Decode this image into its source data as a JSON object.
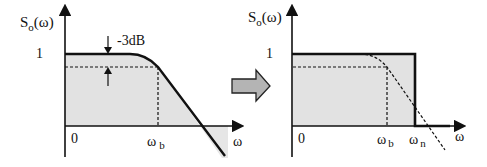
{
  "diagram": {
    "left_plot": {
      "y_axis_label": "S",
      "y_axis_label_sub": "o",
      "y_axis_label_arg": "(ω)",
      "y_tick_one": "1",
      "attenuation_label": "-3dB",
      "origin_label": "0",
      "x_tick_b": "ω",
      "x_tick_b_sub": "b",
      "x_axis_label": "ω"
    },
    "right_plot": {
      "y_axis_label": "S",
      "y_axis_label_sub": "o",
      "y_axis_label_arg": "(ω)",
      "y_tick_one": "1",
      "origin_label": "0",
      "x_tick_b": "ω",
      "x_tick_b_sub": "b",
      "x_tick_n": "ω",
      "x_tick_n_sub": "n",
      "x_axis_label": "ω"
    },
    "transition_arrow": "right-arrow",
    "colors": {
      "line": "#111111",
      "fill": "#e2e2e2",
      "arrow_fill": "#b4b4b4"
    }
  }
}
